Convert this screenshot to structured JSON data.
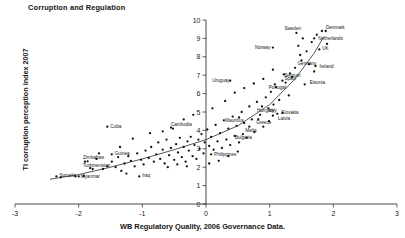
{
  "chart_data": {
    "type": "scatter",
    "title": "Corruption and Regulation",
    "xlabel": "WB Regulatory Quality, 2006 Governance Data.",
    "ylabel": "TI corruption perception index 2007",
    "xlim": [
      -3,
      3
    ],
    "ylim": [
      0,
      10
    ],
    "xticks": [
      "-3",
      "-2",
      "-1",
      "0",
      "1",
      "2",
      "3"
    ],
    "xtick_values": [
      -3,
      -2,
      -1,
      0,
      1,
      2,
      3
    ],
    "yticks": [
      "0",
      "1",
      "2",
      "3",
      "4",
      "5",
      "6",
      "7",
      "8",
      "9",
      "10"
    ],
    "ytick_values": [
      0,
      1,
      2,
      3,
      4,
      5,
      6,
      7,
      8,
      9,
      10
    ],
    "grid": false,
    "legend": "none",
    "labeled_points": [
      {
        "label": "Sweden",
        "x": 1.42,
        "y": 9.3,
        "lx": -12,
        "ly": -2.5
      },
      {
        "label": "Denmark",
        "x": 1.82,
        "y": 9.4,
        "lx": 4,
        "ly": -2.5
      },
      {
        "label": "Netherlands",
        "x": 1.7,
        "y": 9.0,
        "lx": 4,
        "ly": 1.5
      },
      {
        "label": "Norway",
        "x": 1.05,
        "y": 8.5,
        "lx": -18,
        "ly": 1
      },
      {
        "label": "UK",
        "x": 1.78,
        "y": 8.4,
        "lx": 3,
        "ly": 1
      },
      {
        "label": "Germany",
        "x": 1.5,
        "y": 7.8,
        "lx": -4,
        "ly": 4
      },
      {
        "label": "Ireland",
        "x": 1.72,
        "y": 7.5,
        "lx": 4,
        "ly": 1.5
      },
      {
        "label": "Belgium",
        "x": 1.32,
        "y": 7.1,
        "lx": -6,
        "ly": 4
      },
      {
        "label": "Estonia",
        "x": 1.55,
        "y": 6.5,
        "lx": 5,
        "ly": 0
      },
      {
        "label": "Spain",
        "x": 1.2,
        "y": 6.7,
        "lx": 2,
        "ly": -1
      },
      {
        "label": "Portugal",
        "x": 1.08,
        "y": 6.5,
        "lx": -6,
        "ly": 5
      },
      {
        "label": "Uruguay",
        "x": 0.38,
        "y": 6.7,
        "lx": -18,
        "ly": 1
      },
      {
        "label": "Italy",
        "x": 0.98,
        "y": 5.2,
        "lx": 0,
        "ly": 3.5
      },
      {
        "label": "Slovakia",
        "x": 1.12,
        "y": 4.9,
        "lx": 4,
        "ly": 0
      },
      {
        "label": "Latvia",
        "x": 1.05,
        "y": 4.8,
        "lx": 5,
        "ly": 4
      },
      {
        "label": "Hungary",
        "x": 0.88,
        "y": 5.3,
        "lx": -5,
        "ly": 5
      },
      {
        "label": "Greece",
        "x": 0.82,
        "y": 4.6,
        "lx": -2,
        "ly": 4.5
      },
      {
        "label": "Mauritius",
        "x": 0.52,
        "y": 4.7,
        "lx": -14,
        "ly": 4.5
      },
      {
        "label": "Malta",
        "x": 0.68,
        "y": 4.2,
        "lx": -4,
        "ly": 5
      },
      {
        "label": "Bulgaria",
        "x": 0.58,
        "y": 3.8,
        "lx": -8,
        "ly": 5
      },
      {
        "label": "Philippines",
        "x": 0.08,
        "y": 2.7,
        "lx": 3,
        "ly": 1.5
      },
      {
        "label": "Cambodia",
        "x": -0.52,
        "y": 4.1,
        "lx": -2,
        "ly": -2.5
      },
      {
        "label": "Cuba",
        "x": -1.55,
        "y": 4.2,
        "lx": 3,
        "ly": 1
      },
      {
        "label": "Guinea",
        "x": -1.48,
        "y": 2.7,
        "lx": 3,
        "ly": 1
      },
      {
        "label": "Zimbabwe",
        "x": -1.9,
        "y": 2.3,
        "lx": -2,
        "ly": -2.5
      },
      {
        "label": "Turkmenistan",
        "x": -1.78,
        "y": 1.9,
        "lx": -10,
        "ly": -2
      },
      {
        "label": "Iraq",
        "x": -1.05,
        "y": 1.5,
        "lx": 3,
        "ly": 1
      },
      {
        "label": "Somalia",
        "x": -2.35,
        "y": 1.5,
        "lx": 3,
        "ly": 1
      },
      {
        "label": "Myanmar",
        "x": -2.0,
        "y": 1.5,
        "lx": 2,
        "ly": 1.5
      }
    ],
    "unlabeled_points": [
      {
        "x": -2.28,
        "y": 1.45
      },
      {
        "x": -2.05,
        "y": 1.5
      },
      {
        "x": -1.92,
        "y": 1.52
      },
      {
        "x": -1.82,
        "y": 1.95
      },
      {
        "x": -1.86,
        "y": 2.32
      },
      {
        "x": -1.72,
        "y": 2.45
      },
      {
        "x": -1.62,
        "y": 1.9
      },
      {
        "x": -1.55,
        "y": 2.05
      },
      {
        "x": -1.48,
        "y": 2.3
      },
      {
        "x": -1.42,
        "y": 2.0
      },
      {
        "x": -1.38,
        "y": 2.55
      },
      {
        "x": -1.33,
        "y": 1.8
      },
      {
        "x": -1.28,
        "y": 2.2
      },
      {
        "x": -1.22,
        "y": 2.6
      },
      {
        "x": -1.18,
        "y": 2.35
      },
      {
        "x": -1.12,
        "y": 2.05
      },
      {
        "x": -1.08,
        "y": 2.75
      },
      {
        "x": -1.02,
        "y": 2.4
      },
      {
        "x": -0.98,
        "y": 2.15
      },
      {
        "x": -0.95,
        "y": 2.9
      },
      {
        "x": -0.9,
        "y": 2.5
      },
      {
        "x": -0.86,
        "y": 3.1
      },
      {
        "x": -0.82,
        "y": 2.3
      },
      {
        "x": -0.78,
        "y": 2.7
      },
      {
        "x": -0.75,
        "y": 3.35
      },
      {
        "x": -0.72,
        "y": 2.45
      },
      {
        "x": -0.68,
        "y": 2.95
      },
      {
        "x": -0.65,
        "y": 2.2
      },
      {
        "x": -0.62,
        "y": 3.5
      },
      {
        "x": -0.58,
        "y": 2.65
      },
      {
        "x": -0.55,
        "y": 3.05
      },
      {
        "x": -0.5,
        "y": 2.4
      },
      {
        "x": -0.47,
        "y": 3.25
      },
      {
        "x": -0.44,
        "y": 2.8
      },
      {
        "x": -0.41,
        "y": 3.6
      },
      {
        "x": -0.38,
        "y": 2.55
      },
      {
        "x": -0.35,
        "y": 3.1
      },
      {
        "x": -0.32,
        "y": 2.3
      },
      {
        "x": -0.29,
        "y": 3.4
      },
      {
        "x": -0.27,
        "y": 2.9
      },
      {
        "x": -0.24,
        "y": 3.65
      },
      {
        "x": -0.21,
        "y": 2.6
      },
      {
        "x": -0.18,
        "y": 3.2
      },
      {
        "x": -0.15,
        "y": 2.45
      },
      {
        "x": -0.12,
        "y": 3.5
      },
      {
        "x": -0.1,
        "y": 3.0
      },
      {
        "x": -0.07,
        "y": 3.8
      },
      {
        "x": -0.04,
        "y": 2.75
      },
      {
        "x": -0.02,
        "y": 3.35
      },
      {
        "x": 0.02,
        "y": 4.05
      },
      {
        "x": 0.05,
        "y": 3.15
      },
      {
        "x": 0.08,
        "y": 3.65
      },
      {
        "x": 0.12,
        "y": 2.95
      },
      {
        "x": 0.15,
        "y": 4.3
      },
      {
        "x": 0.18,
        "y": 3.4
      },
      {
        "x": 0.22,
        "y": 3.85
      },
      {
        "x": 0.25,
        "y": 3.05
      },
      {
        "x": 0.28,
        "y": 4.55
      },
      {
        "x": 0.32,
        "y": 3.5
      },
      {
        "x": 0.35,
        "y": 4.1
      },
      {
        "x": 0.38,
        "y": 3.2
      },
      {
        "x": 0.42,
        "y": 4.75
      },
      {
        "x": 0.45,
        "y": 3.7
      },
      {
        "x": 0.48,
        "y": 4.25
      },
      {
        "x": 0.52,
        "y": 3.35
      },
      {
        "x": 0.56,
        "y": 5.0
      },
      {
        "x": 0.6,
        "y": 4.4
      },
      {
        "x": 0.64,
        "y": 3.6
      },
      {
        "x": 0.68,
        "y": 5.3
      },
      {
        "x": 0.72,
        "y": 4.6
      },
      {
        "x": 0.76,
        "y": 3.9
      },
      {
        "x": 0.8,
        "y": 5.55
      },
      {
        "x": 0.85,
        "y": 4.85
      },
      {
        "x": 0.9,
        "y": 4.2
      },
      {
        "x": 0.94,
        "y": 5.8
      },
      {
        "x": 0.99,
        "y": 4.5
      },
      {
        "x": 1.02,
        "y": 6.1
      },
      {
        "x": 1.06,
        "y": 5.4
      },
      {
        "x": 1.1,
        "y": 6.35
      },
      {
        "x": 1.15,
        "y": 5.65
      },
      {
        "x": 1.2,
        "y": 4.95
      },
      {
        "x": 1.25,
        "y": 6.6
      },
      {
        "x": 1.3,
        "y": 5.9
      },
      {
        "x": 1.35,
        "y": 6.9
      },
      {
        "x": 1.4,
        "y": 7.4
      },
      {
        "x": 1.45,
        "y": 8.6
      },
      {
        "x": 1.48,
        "y": 8.1
      },
      {
        "x": 1.52,
        "y": 9.0
      },
      {
        "x": 1.58,
        "y": 8.3
      },
      {
        "x": 1.62,
        "y": 7.6
      },
      {
        "x": 1.66,
        "y": 8.8
      },
      {
        "x": 1.7,
        "y": 7.2
      },
      {
        "x": 1.74,
        "y": 9.2
      },
      {
        "x": 1.88,
        "y": 9.4
      },
      {
        "x": 1.9,
        "y": 8.7
      },
      {
        "x": -0.55,
        "y": 4.15
      },
      {
        "x": -0.35,
        "y": 4.6
      },
      {
        "x": -0.2,
        "y": 4.85
      },
      {
        "x": 0.1,
        "y": 5.2
      },
      {
        "x": 0.3,
        "y": 5.6
      },
      {
        "x": -0.68,
        "y": 3.95
      },
      {
        "x": -1.15,
        "y": 3.55
      },
      {
        "x": -1.35,
        "y": 3.1
      },
      {
        "x": -0.88,
        "y": 3.85
      },
      {
        "x": 0.6,
        "y": 6.3
      },
      {
        "x": 0.45,
        "y": 6.05
      },
      {
        "x": 0.75,
        "y": 6.55
      },
      {
        "x": 0.2,
        "y": 2.35
      },
      {
        "x": 0.35,
        "y": 2.6
      },
      {
        "x": 0.5,
        "y": 2.85
      },
      {
        "x": -1.68,
        "y": 2.75
      },
      {
        "x": -1.25,
        "y": 1.65
      },
      {
        "x": -0.6,
        "y": 2.0
      },
      {
        "x": -0.45,
        "y": 2.15
      },
      {
        "x": -0.3,
        "y": 2.05
      },
      {
        "x": 0.05,
        "y": 2.2
      },
      {
        "x": 1.22,
        "y": 7.05
      },
      {
        "x": 1.05,
        "y": 7.3
      },
      {
        "x": 0.9,
        "y": 6.8
      }
    ],
    "fit_curve": [
      {
        "x": -2.45,
        "y": 1.35
      },
      {
        "x": -2.0,
        "y": 1.6
      },
      {
        "x": -1.5,
        "y": 2.0
      },
      {
        "x": -1.0,
        "y": 2.45
      },
      {
        "x": -0.5,
        "y": 2.95
      },
      {
        "x": 0.0,
        "y": 3.5
      },
      {
        "x": 0.5,
        "y": 4.25
      },
      {
        "x": 1.0,
        "y": 5.4
      },
      {
        "x": 1.4,
        "y": 6.8
      },
      {
        "x": 1.7,
        "y": 8.2
      },
      {
        "x": 1.85,
        "y": 9.1
      }
    ]
  }
}
